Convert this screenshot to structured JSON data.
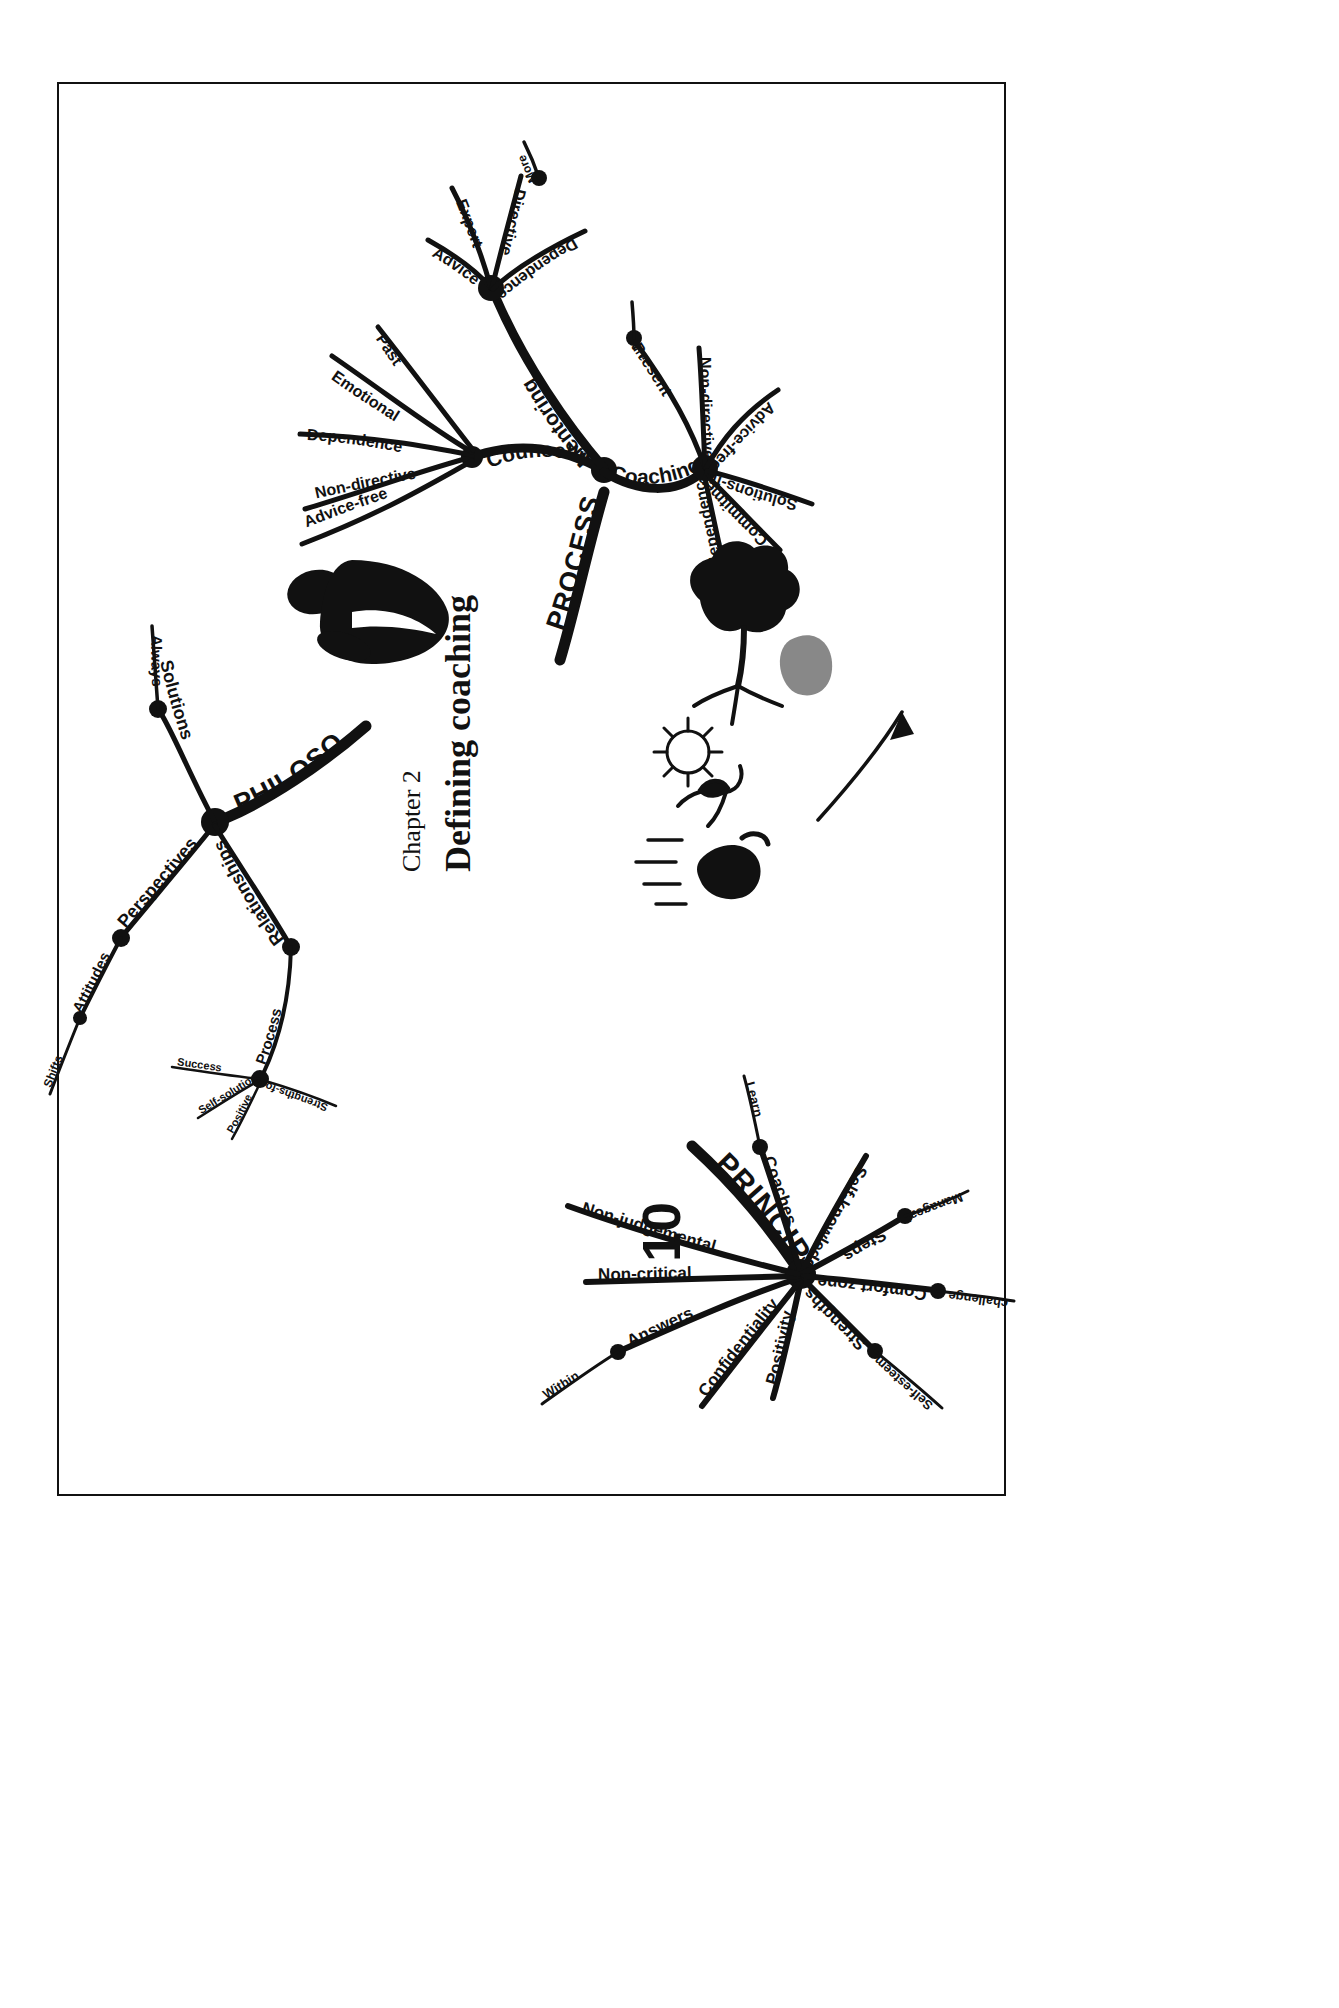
{
  "page": {
    "chapter_label": "Chapter 2",
    "title": "Defining coaching",
    "background_color": "#ffffff",
    "ink_color": "#111111"
  },
  "mindmap": {
    "type": "mind-map",
    "orientation": "rotated-90-clockwise",
    "central_topic": "Defining coaching",
    "branches": [
      {
        "name": "PROCESSES",
        "label": "PROCESSES",
        "children": [
          {
            "name": "Counselling",
            "label": "Counselling",
            "children": [
              {
                "label": "Non-directive"
              },
              {
                "label": "Dependence"
              },
              {
                "label": "Emotional"
              },
              {
                "label": "Past"
              },
              {
                "label": "Advice-free"
              }
            ]
          },
          {
            "name": "Mentoring",
            "label": "Mentoring",
            "children": [
              {
                "label": "Advice"
              },
              {
                "label": "Expert"
              },
              {
                "label": "Directive",
                "children": [
                  {
                    "label": "More"
                  }
                ]
              },
              {
                "label": "Dependence"
              }
            ]
          },
          {
            "name": "Coaching",
            "label": "Coaching",
            "children": [
              {
                "label": "Present",
                "children": [
                  {
                    "label": "Future"
                  }
                ]
              },
              {
                "label": "Non-directive"
              },
              {
                "label": "Advice-free"
              },
              {
                "label": "Solutions-free"
              },
              {
                "label": "Commitment"
              },
              {
                "label": "Independence"
              }
            ]
          }
        ]
      },
      {
        "name": "PHILOSOPHY",
        "label": "PHILOSOPHY",
        "children": [
          {
            "label": "Solutions",
            "children": [
              {
                "label": "Always"
              }
            ]
          },
          {
            "label": "Perspectives",
            "children": [
              {
                "label": "Attitudes",
                "children": [
                  {
                    "label": "Shifts"
                  }
                ]
              }
            ]
          },
          {
            "label": "Relationships",
            "children": [
              {
                "label": "Process",
                "children": [
                  {
                    "label": "Success"
                  },
                  {
                    "label": "Self-solution"
                  },
                  {
                    "label": "Positive"
                  },
                  {
                    "label": "Strengths-focus"
                  }
                ]
              }
            ]
          }
        ]
      },
      {
        "name": "PRINCIPLES",
        "label": "PRINCIPLES",
        "number": "10",
        "children": [
          {
            "label": "Coaches",
            "children": [
              {
                "label": "Learn"
              }
            ]
          },
          {
            "label": "Self-knowledge"
          },
          {
            "label": "Steps",
            "children": [
              {
                "label": "Manageable"
              }
            ]
          },
          {
            "label": "Comfort zone",
            "children": [
              {
                "label": "challenge"
              }
            ]
          },
          {
            "label": "Strengths",
            "children": [
              {
                "label": "Self-esteem"
              }
            ]
          },
          {
            "label": "Positivity"
          },
          {
            "label": "Confidentiality"
          },
          {
            "label": "Answers",
            "children": [
              {
                "label": "Within"
              }
            ]
          },
          {
            "label": "Non-critical"
          },
          {
            "label": "Non-judgemental"
          }
        ]
      }
    ],
    "illustrations": [
      {
        "name": "person-silhouette",
        "description": "filled black figure of a person"
      },
      {
        "name": "tree-transformation",
        "description": "tree with shadow and arrow"
      },
      {
        "name": "sun-icon",
        "description": "sun with rays"
      },
      {
        "name": "seedling-icon",
        "description": "sprouting plant"
      },
      {
        "name": "running-figure-icon",
        "description": "figure with motion lines"
      },
      {
        "name": "arrow-icon",
        "description": "long straight arrow pointing up-right"
      }
    ]
  }
}
